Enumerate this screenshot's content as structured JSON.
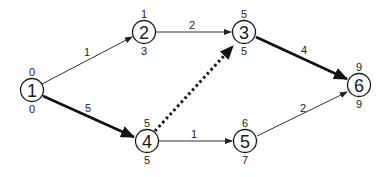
{
  "diagram": {
    "type": "activity-on-node network (critical path)",
    "nodes": [
      {
        "id": "1",
        "label": "1",
        "top": "0",
        "bottom": "0",
        "x": 32,
        "y": 90
      },
      {
        "id": "2",
        "label": "2",
        "top": "1",
        "bottom": "3",
        "x": 144,
        "y": 32
      },
      {
        "id": "3",
        "label": "3",
        "top": "5",
        "bottom": "5",
        "x": 244,
        "y": 32
      },
      {
        "id": "4",
        "label": "4",
        "top": "5",
        "bottom": "5",
        "x": 147,
        "y": 141
      },
      {
        "id": "5",
        "label": "5",
        "top": "6",
        "bottom": "7",
        "x": 245,
        "y": 141
      },
      {
        "id": "6",
        "label": "6",
        "top": "9",
        "bottom": "9",
        "x": 359,
        "y": 85
      }
    ],
    "edges": [
      {
        "from": "1",
        "to": "2",
        "weight": "1",
        "style": "thin"
      },
      {
        "from": "1",
        "to": "4",
        "weight": "5",
        "style": "thick"
      },
      {
        "from": "2",
        "to": "3",
        "weight": "2",
        "style": "thin"
      },
      {
        "from": "4",
        "to": "3",
        "weight": "",
        "style": "dotted"
      },
      {
        "from": "4",
        "to": "5",
        "weight": "1",
        "style": "thin"
      },
      {
        "from": "3",
        "to": "6",
        "weight": "4",
        "style": "thick"
      },
      {
        "from": "5",
        "to": "6",
        "weight": "2",
        "style": "thin"
      }
    ]
  }
}
